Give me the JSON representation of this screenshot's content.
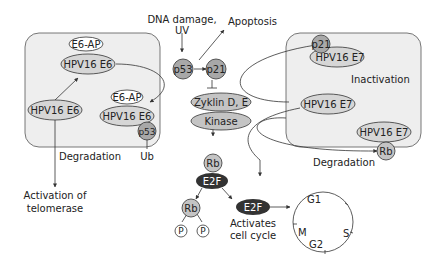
{
  "colors": {
    "panel_fill": "#eeeeee",
    "panel_stroke": "#555555",
    "protein_fill": "#c4c4c4",
    "light_fill": "#d6d6d6",
    "white_fill": "#ffffff",
    "dark_fill": "#333333",
    "line": "#333333"
  },
  "top": {
    "stimulus": "DNA damage,",
    "stimulus2": "UV",
    "apoptosis": "Apoptosis"
  },
  "left_panel": {
    "e6ap_top": "E6-AP",
    "e6_top": "HPV16 E6",
    "e6_left": "HPV16 E6",
    "e6ap_bottom": "E6-AP",
    "e6_bottom": "HPV16 E6",
    "p53": "p53",
    "ub": "Ub",
    "caption": "Degradation"
  },
  "below_left": {
    "line1": "Activation of",
    "line2": "telomerase"
  },
  "center": {
    "p53": "p53",
    "p21": "p21",
    "zyklin": "Zyklin D, E",
    "kinase": "Kinase",
    "rb": "Rb",
    "e2f": "E2F",
    "rb_free": "Rb",
    "p_left": "P",
    "p_right": "P",
    "e2f_free": "E2F",
    "activates1": "Activates",
    "activates2": "cell cycle"
  },
  "right_panel": {
    "p21": "p21",
    "e7_top": "HPV16 E7",
    "inactivation": "Inactivation",
    "e7_mid": "HPV16 E7",
    "e7_bottom": "HPV16 E7",
    "rb": "Rb",
    "caption": "Degradation"
  },
  "cell_cycle": {
    "g1": "G1",
    "s": "S",
    "g2": "G2",
    "m": "M"
  }
}
